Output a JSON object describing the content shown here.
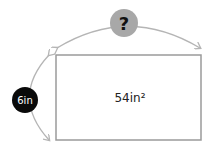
{
  "diagram": {
    "area_label": "54in²",
    "height_label": "6in",
    "width_label": "?",
    "colors": {
      "rect_stroke": "#9a9a9a",
      "arrow_stroke": "#b5b5b5",
      "question_fill": "#a8a8a8",
      "height_fill": "#0a0a0a"
    }
  }
}
